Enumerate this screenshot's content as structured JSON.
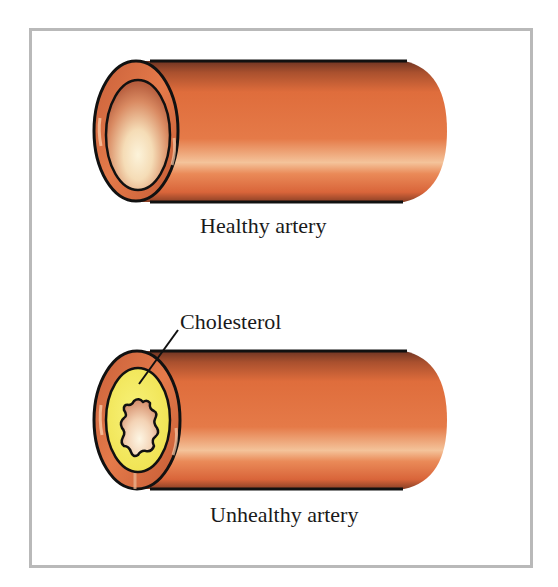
{
  "figure": {
    "frame_border_color": "#b9b9b9",
    "background": "#ffffff"
  },
  "arteries": [
    {
      "id": "healthy",
      "label": "Healthy artery",
      "wall_color": "#e0703e",
      "wall_dark": "#7a3a22",
      "wall_highlight": "#f6c59a",
      "lumen_center": "#fbf1d6",
      "lumen_edge": "#c4694a",
      "outline": "#111111"
    },
    {
      "id": "unhealthy",
      "label": "Unhealthy artery",
      "wall_color": "#e0703e",
      "wall_dark": "#7a3a22",
      "wall_highlight": "#f6c59a",
      "plaque_color": "#f3ec5a",
      "plaque_label": "Cholesterol",
      "lumen_center": "#fbf1d6",
      "lumen_edge": "#d9906c",
      "outline": "#111111"
    }
  ]
}
